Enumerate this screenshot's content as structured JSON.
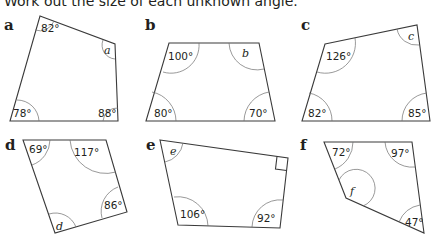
{
  "instruction": "Work out the size of each unknown angle.",
  "shapes": [
    {
      "label": "a",
      "angles": {
        "top_left": "82°",
        "top_right": "a",
        "bottom_right": "88°",
        "bottom_left": "78°"
      }
    },
    {
      "label": "b",
      "angles": {
        "top_left": "100°",
        "top_right": "b",
        "bottom_right": "70°",
        "bottom_left": "80°"
      }
    },
    {
      "label": "c",
      "angles": {
        "top_left": "126°",
        "top_right": "c",
        "bottom_right": "85°",
        "bottom_left": "82°"
      }
    },
    {
      "label": "d",
      "angles": {
        "top_left": "69°",
        "top_right": "117°",
        "right": "86°",
        "bottom": "d"
      }
    },
    {
      "label": "e",
      "angles": {
        "top_left": "e",
        "top_right": "right-angle",
        "bottom_right": "92°",
        "bottom_left": "106°"
      }
    },
    {
      "label": "f",
      "angles": {
        "top_left": "72°",
        "top_right": "97°",
        "bottom_right": "47°",
        "reflex_left": "f"
      }
    }
  ]
}
